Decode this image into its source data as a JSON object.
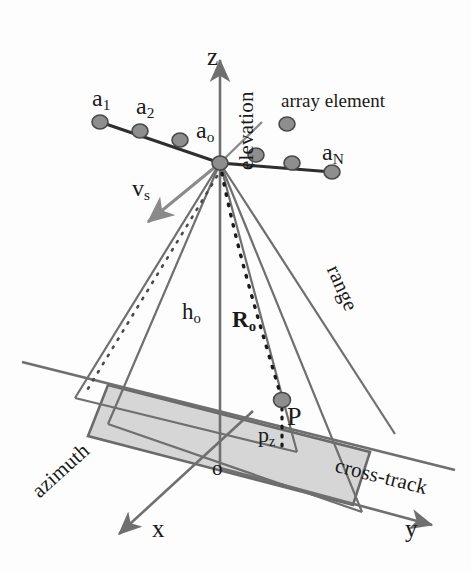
{
  "figure": {
    "width": 471,
    "height": 573,
    "background": "#fdfdfd"
  },
  "colors": {
    "ink": "#1a1a1a",
    "line_dark": "#3b3b3b",
    "line_gray": "#6f6f6f",
    "swath_fill": "#d6d6d6",
    "swath_edge": "#6a6a6a",
    "element_fill": "#8e8e8e",
    "element_edge": "#4a4a4a",
    "arrow_gray": "#8a8a8a"
  },
  "axes": [
    {
      "id": "z",
      "letter": "z",
      "word": "elevation",
      "direction": "up"
    },
    {
      "id": "x",
      "letter": "x",
      "word": "azimuth",
      "direction": "down-left"
    },
    {
      "id": "y",
      "letter": "y",
      "word": "cross-track",
      "direction": "down-right"
    }
  ],
  "origin": {
    "label": "o",
    "x": 220,
    "y": 468
  },
  "array": {
    "center_label": "a",
    "center_sub": "o",
    "first_label": "a",
    "first_sub": "1",
    "second_label": "a",
    "second_sub": "2",
    "last_label": "a",
    "last_sub": "N",
    "legend_label": "array element",
    "element_count": 7,
    "elements": [
      {
        "x": 100,
        "y": 122
      },
      {
        "x": 140,
        "y": 131
      },
      {
        "x": 180,
        "y": 140
      },
      {
        "x": 220,
        "y": 163
      },
      {
        "x": 256,
        "y": 155
      },
      {
        "x": 292,
        "y": 163
      },
      {
        "x": 332,
        "y": 172
      }
    ],
    "legend_dot": {
      "x": 287,
      "y": 124
    }
  },
  "velocity": {
    "label": "v",
    "sub": "s",
    "description": "sensor velocity vector"
  },
  "distances": [
    {
      "label": "h",
      "sub": "o",
      "meaning": "platform altitude",
      "x": 191,
      "y": 312
    },
    {
      "label": "R",
      "sub": "o",
      "meaning": "slant range to scene center",
      "x": 241,
      "y": 320
    }
  ],
  "range_word": "range",
  "target": {
    "label": "P",
    "height_label": "p",
    "height_sub": "z",
    "dot": {
      "x": 282,
      "y": 400
    }
  }
}
